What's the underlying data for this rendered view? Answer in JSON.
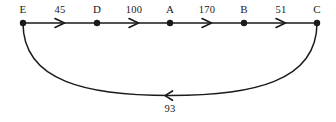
{
  "diagram": {
    "type": "directed-graph-cycle",
    "title": "",
    "stroke_color": "#1a1a1a",
    "background_color": "#ffffff",
    "nodes": [
      {
        "id": "E",
        "label": "E",
        "x": 23,
        "y": 23,
        "label_x": 23,
        "label_y": 9
      },
      {
        "id": "D",
        "label": "D",
        "x": 97,
        "y": 23,
        "label_x": 97,
        "label_y": 9
      },
      {
        "id": "A",
        "label": "A",
        "x": 170,
        "y": 23,
        "label_x": 170,
        "label_y": 9
      },
      {
        "id": "B",
        "label": "B",
        "x": 244,
        "y": 23,
        "label_x": 244,
        "label_y": 9
      },
      {
        "id": "C",
        "label": "C",
        "x": 317,
        "y": 23,
        "label_x": 317,
        "label_y": 9
      }
    ],
    "edges": [
      {
        "from": "E",
        "to": "D",
        "weight": "45",
        "label_x": 60,
        "label_y": 9,
        "arrow_x": 60,
        "shape": "straight"
      },
      {
        "from": "D",
        "to": "A",
        "weight": "100",
        "label_x": 134,
        "label_y": 9,
        "arrow_x": 134,
        "shape": "straight"
      },
      {
        "from": "A",
        "to": "B",
        "weight": "170",
        "label_x": 207,
        "label_y": 9,
        "arrow_x": 207,
        "shape": "straight"
      },
      {
        "from": "B",
        "to": "C",
        "weight": "51",
        "label_x": 281,
        "label_y": 9,
        "arrow_x": 281,
        "shape": "straight"
      },
      {
        "from": "C",
        "to": "E",
        "weight": "93",
        "label_x": 170,
        "label_y": 108,
        "arrow_x": 170,
        "shape": "arc-below"
      }
    ]
  }
}
